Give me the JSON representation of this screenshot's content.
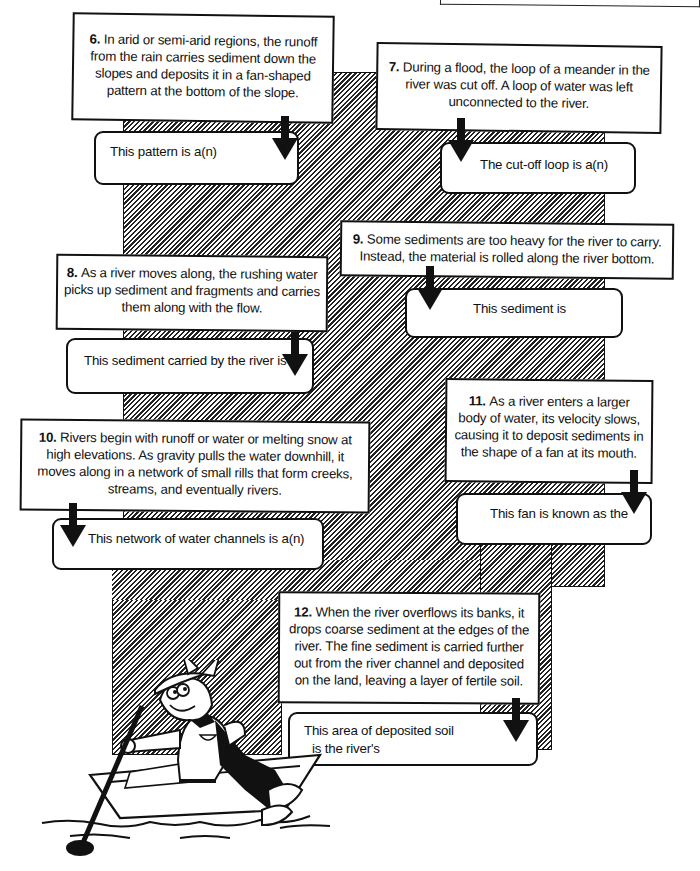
{
  "worksheet": {
    "topic": "River features and sediment",
    "questions": [
      {
        "number": "6.",
        "prompt": "In arid or semi-arid regions, the runoff from the rain carries sediment down the slopes and deposits it in a fan-shaped pattern at the bottom of the slope.",
        "answer_stem": "This pattern is a(n)",
        "answer_value": ""
      },
      {
        "number": "7.",
        "prompt": "During a flood, the loop of a meander in the river was cut off. A loop of water was left unconnected to the river.",
        "answer_stem": "The cut-off loop is a(n)",
        "answer_value": ""
      },
      {
        "number": "8.",
        "prompt": "As a river moves along, the rushing water picks up sediment and fragments and carries them along with the flow.",
        "answer_stem": "This sediment carried by the river is",
        "answer_value": ""
      },
      {
        "number": "9.",
        "prompt": "Some sediments are too heavy for the river to carry. Instead, the material is rolled along the river bottom.",
        "answer_stem": "This sediment is",
        "answer_value": ""
      },
      {
        "number": "10.",
        "prompt": "Rivers begin with runoff or water or melting snow at high elevations. As gravity pulls the water downhill, it moves along in a network of small rills that form creeks, streams, and eventually rivers.",
        "answer_stem": "This network of water channels is a(n)",
        "answer_value": ""
      },
      {
        "number": "11.",
        "prompt": "As a river enters a larger body of water, its velocity slows, causing it to deposit sediments in the shape of a fan at its mouth.",
        "answer_stem": "This fan is known as the",
        "answer_value": ""
      },
      {
        "number": "12.",
        "prompt": "When the river overflows its banks, it drops coarse sediment at the edges of the river. The fine sediment is carried further out from the river channel and deposited on the land, leaving a layer of fertile soil.",
        "answer_stem_line1": "This area of deposited soil",
        "answer_stem_line2": "is the river's",
        "answer_value": ""
      }
    ],
    "illustration": "cartoon-rower-in-canoe",
    "icons": {
      "arrow": "down-arrow-icon"
    },
    "colors": {
      "ink": "#111111",
      "paper": "#ffffff",
      "hatch": "#222222"
    }
  }
}
